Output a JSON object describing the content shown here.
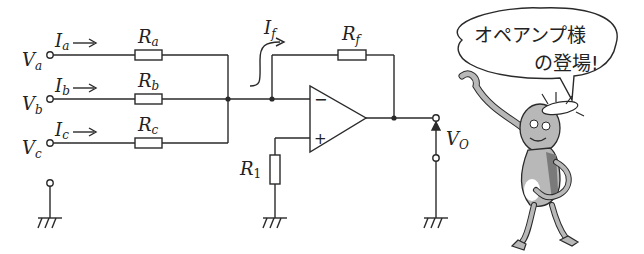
{
  "diagram": {
    "type": "inverting summing amplifier (op-amp adder)",
    "inputs": [
      {
        "voltage": "V",
        "voltage_sub": "a",
        "current": "I",
        "current_sub": "a",
        "resistor": "R",
        "resistor_sub": "a"
      },
      {
        "voltage": "V",
        "voltage_sub": "b",
        "current": "I",
        "current_sub": "b",
        "resistor": "R",
        "resistor_sub": "b"
      },
      {
        "voltage": "V",
        "voltage_sub": "c",
        "current": "I",
        "current_sub": "c",
        "resistor": "R",
        "resistor_sub": "c"
      }
    ],
    "feedback": {
      "current": "I",
      "current_sub": "f",
      "resistor": "R",
      "resistor_sub": "f"
    },
    "bias_resistor": {
      "label": "R",
      "sub": "1"
    },
    "opamp": {
      "inverting_symbol": "−",
      "noninverting_symbol": "+"
    },
    "output": {
      "label": "V",
      "sub": "O"
    },
    "arrow_glyph": "→"
  },
  "mascot": {
    "speech_line1": "オペアンプ様",
    "speech_line2": "の登場!"
  },
  "colors": {
    "line": "#2a2a2a",
    "mascot_fill": "#b8b8b8",
    "mascot_dark": "#7a7a7a"
  }
}
